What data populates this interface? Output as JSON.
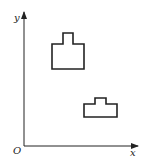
{
  "axes": {
    "y_label": "y",
    "x_label": "x",
    "origin_label": "O",
    "color": "#222222"
  },
  "shapes": [
    {
      "name": "upper-large-shape",
      "points": "52,69 52,44 63,44 63,33 73,33 73,44 84,44 84,69"
    },
    {
      "name": "lower-small-shape",
      "points": "84,117 84,104 95,104 95,98 106,98 106,104 117,104 117,117"
    }
  ]
}
